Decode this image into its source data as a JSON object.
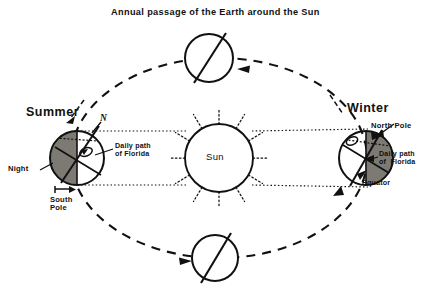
{
  "figure": {
    "title": "Annual passage of the Earth around the Sun",
    "type": "astronomy-diagram",
    "background_color": "#ffffff",
    "ink_color": "#111111",
    "night_shade_color": "#7d7a74"
  },
  "sun": {
    "label": "Sun",
    "ray_count": 12,
    "ray_style": "dotted"
  },
  "orbit": {
    "style": "dashed",
    "direction_note": "counter-clockwise",
    "arrow_count": 3
  },
  "positions": {
    "summer": {
      "season_label": "Summer",
      "axis_label": "N",
      "night_label": "Night",
      "pole_label": "South\nPole",
      "daily_path_label": "Daily path\nof Florida",
      "night_side": "left"
    },
    "winter": {
      "season_label": "Winter",
      "pole_label": "North Pole",
      "daily_path_label": "Daily path\nof  Florida",
      "equator_label": "Equator",
      "night_side": "right"
    },
    "top": {
      "season_label": "",
      "axis_shown": true
    },
    "bottom": {
      "season_label": "",
      "axis_shown": true
    }
  }
}
